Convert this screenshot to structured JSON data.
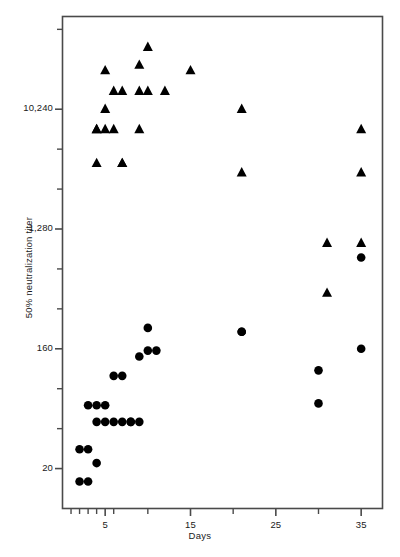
{
  "chart_data": {
    "type": "scatter",
    "title": "",
    "xlabel": "Days",
    "ylabel": "50% neutralization titer",
    "yscale": "log",
    "ylim": [
      10,
      51200
    ],
    "xlim": [
      0,
      37.5
    ],
    "grid": false,
    "legend": "none",
    "ytick_labels": [
      "10,240",
      "1,280",
      "160",
      "20"
    ],
    "ytick_values": [
      10240,
      1280,
      160,
      20
    ],
    "yminor_values": [
      40960,
      2560,
      320,
      40,
      81920,
      5120,
      640,
      80
    ],
    "xtick_labels": [
      "5",
      "15",
      "25",
      "35"
    ],
    "xtick_values": [
      5,
      15,
      25,
      35
    ],
    "xminor_values": [
      1,
      2,
      3,
      4,
      6,
      10,
      20,
      30
    ],
    "series": [
      {
        "name": "triangles",
        "marker": "triangle",
        "color": "#000000",
        "points": [
          [
            4,
            7200
          ],
          [
            4,
            7200
          ],
          [
            4,
            4000
          ],
          [
            5,
            20000
          ],
          [
            5,
            10240
          ],
          [
            5,
            7200
          ],
          [
            6,
            14000
          ],
          [
            6,
            7200
          ],
          [
            7,
            14000
          ],
          [
            7,
            4000
          ],
          [
            7,
            4000
          ],
          [
            9,
            22000
          ],
          [
            9,
            14000
          ],
          [
            9,
            7200
          ],
          [
            10,
            30000
          ],
          [
            10,
            14000
          ],
          [
            12,
            14000
          ],
          [
            15,
            20000
          ],
          [
            21,
            10240
          ],
          [
            21,
            3400
          ],
          [
            31,
            1000
          ],
          [
            31,
            420
          ],
          [
            35,
            7200
          ],
          [
            35,
            3400
          ],
          [
            35,
            1000
          ]
        ]
      },
      {
        "name": "circles",
        "marker": "circle",
        "color": "#000000",
        "points": [
          [
            2,
            28
          ],
          [
            2,
            16
          ],
          [
            3,
            60
          ],
          [
            3,
            28
          ],
          [
            3,
            16
          ],
          [
            4,
            60
          ],
          [
            4,
            45
          ],
          [
            4,
            22
          ],
          [
            5,
            60
          ],
          [
            5,
            45
          ],
          [
            6,
            100
          ],
          [
            6,
            45
          ],
          [
            7,
            100
          ],
          [
            7,
            45
          ],
          [
            8,
            45
          ],
          [
            8,
            45
          ],
          [
            9,
            140
          ],
          [
            9,
            45
          ],
          [
            10,
            230
          ],
          [
            10,
            155
          ],
          [
            11,
            155
          ],
          [
            21,
            215
          ],
          [
            21,
            215
          ],
          [
            30,
            110
          ],
          [
            30,
            62
          ],
          [
            35,
            780
          ],
          [
            35,
            160
          ]
        ]
      }
    ]
  },
  "axes": {
    "y_title": "50% neutralization titer",
    "x_title": "Days"
  }
}
